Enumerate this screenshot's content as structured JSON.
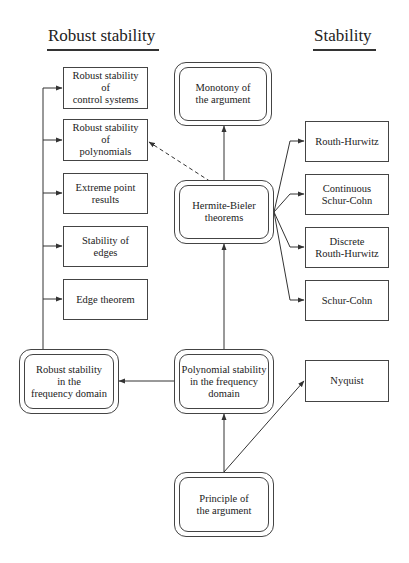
{
  "page_header": "",
  "headings": {
    "left": "Robust stability",
    "right": "Stability"
  },
  "nodes": {
    "robust_control_systems": "Robust stability\nof\ncontrol systems",
    "robust_polynomials": "Robust stability\nof\npolynomials",
    "extreme_point": "Extreme point\nresults",
    "stability_edges": "Stability  of\nedges",
    "edge_theorem": "Edge theorem",
    "robust_frequency": "Robust stability\nin the\nfrequency domain",
    "monotony": "Monotony of\nthe argument",
    "hermite_bieler": "Hermite-Bieler\ntheorems",
    "polynomial_frequency": "Polynomial stability\nin the frequency\ndomain",
    "principle": "Principle of\nthe argument",
    "routh_hurwitz": "Routh-Hurwitz",
    "continuous_schur_cohn": "Continuous\nSchur-Cohn",
    "discrete_routh_hurwitz": "Discrete\nRouth-Hurwitz",
    "schur_cohn": "Schur-Cohn",
    "nyquist": "Nyquist"
  },
  "edges": [
    {
      "from": "principle",
      "to": "polynomial_frequency",
      "style": "solid"
    },
    {
      "from": "principle",
      "to": "nyquist",
      "style": "solid"
    },
    {
      "from": "polynomial_frequency",
      "to": "hermite_bieler",
      "style": "solid"
    },
    {
      "from": "polynomial_frequency",
      "to": "robust_frequency",
      "style": "solid"
    },
    {
      "from": "hermite_bieler",
      "to": "monotony",
      "style": "solid"
    },
    {
      "from": "hermite_bieler",
      "to": "robust_polynomials",
      "style": "dashed"
    },
    {
      "from": "hermite_bieler",
      "to": "routh_hurwitz",
      "style": "solid"
    },
    {
      "from": "hermite_bieler",
      "to": "continuous_schur_cohn",
      "style": "solid"
    },
    {
      "from": "hermite_bieler",
      "to": "discrete_routh_hurwitz",
      "style": "solid"
    },
    {
      "from": "hermite_bieler",
      "to": "schur_cohn",
      "style": "solid"
    },
    {
      "from": "robust_frequency",
      "to": "robust_control_systems",
      "style": "solid"
    },
    {
      "from": "robust_frequency",
      "to": "robust_polynomials",
      "style": "solid"
    },
    {
      "from": "robust_frequency",
      "to": "extreme_point",
      "style": "solid"
    },
    {
      "from": "robust_frequency",
      "to": "stability_edges",
      "style": "solid"
    },
    {
      "from": "robust_frequency",
      "to": "edge_theorem",
      "style": "solid"
    }
  ],
  "colors": {
    "line": "#333333",
    "text": "#222222",
    "background": "#ffffff"
  }
}
